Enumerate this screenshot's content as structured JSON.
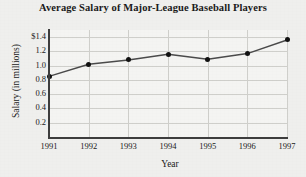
{
  "chart_data": {
    "type": "line",
    "title": "Average Salary of Major-League Baseball Players",
    "xlabel": "Year",
    "ylabel": "Salary (in millions)",
    "categories": [
      "1991",
      "1992",
      "1993",
      "1994",
      "1995",
      "1996",
      "1997"
    ],
    "x": [
      1991,
      1992,
      1993,
      1994,
      1995,
      1996,
      1997
    ],
    "values": [
      0.85,
      1.02,
      1.08,
      1.16,
      1.09,
      1.17,
      1.36
    ],
    "series": [
      {
        "name": "Average Salary",
        "values": [
          0.85,
          1.02,
          1.08,
          1.16,
          1.09,
          1.17,
          1.36
        ]
      }
    ],
    "xlim": [
      1991,
      1997
    ],
    "ylim": [
      0.0,
      1.5
    ],
    "ytick_labels": [
      "$1.4",
      "1.2",
      "1.0",
      "0.8",
      "0.6",
      "0.4",
      "0.2"
    ],
    "ytick_values": [
      1.4,
      1.2,
      1.0,
      0.8,
      0.6,
      0.4,
      0.2
    ],
    "xtick_labels": [
      "1991",
      "1992",
      "1993",
      "1994",
      "1995",
      "1996",
      "1997"
    ],
    "grid": true,
    "legend": "none",
    "marker": "filled-circle",
    "line_color": "#4a4a4a",
    "marker_color": "#111111",
    "grid_color": "#cfcfcb",
    "axis_color": "#3d3d3d",
    "background_color": "#efefed",
    "plot_background_color": "#f4f4f2"
  }
}
